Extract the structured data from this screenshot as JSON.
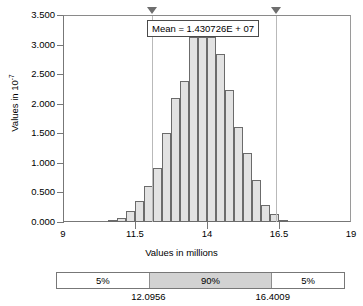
{
  "chart_data": {
    "type": "bar",
    "title": "",
    "xlabel": "Values in millions",
    "ylabel_html": "Values in 10<sup>-7</sup>",
    "ylabel": "Values in 10^-7",
    "xlim": [
      9,
      19
    ],
    "ylim": [
      0,
      3.5
    ],
    "xticks": [
      "9",
      "11.5",
      "14",
      "16.5",
      "19"
    ],
    "xtick_values": [
      9,
      11.5,
      14,
      16.5,
      19
    ],
    "yticks": [
      "0.000",
      "0.500",
      "1.000",
      "1.500",
      "2.000",
      "2.500",
      "3.000",
      "3.500"
    ],
    "ytick_values": [
      0.0,
      0.5,
      1.0,
      1.5,
      2.0,
      2.5,
      3.0,
      3.5
    ],
    "grid": false,
    "legend": "none",
    "bin_width": 0.3125,
    "bin_starts": [
      10.5625,
      10.875,
      11.1875,
      11.5,
      11.8125,
      12.125,
      12.4375,
      12.75,
      13.0625,
      13.375,
      13.6875,
      14.0,
      14.3125,
      14.625,
      14.9375,
      15.25,
      15.5625,
      15.875,
      16.1875,
      16.5,
      16.8125,
      17.125,
      17.4375
    ],
    "values": [
      0.03,
      0.07,
      0.19,
      0.35,
      0.62,
      0.91,
      1.51,
      2.11,
      2.4,
      3.14,
      3.14,
      3.14,
      2.86,
      2.25,
      1.61,
      1.17,
      0.72,
      0.29,
      0.14,
      0.03
    ],
    "annotations": [
      {
        "name": "mean-label",
        "text": "Mean = 1.430726E + 07"
      }
    ],
    "percentile_markers": [
      {
        "name": "lower-5pct-marker",
        "value": 12.0956
      },
      {
        "name": "upper-95pct-marker",
        "value": 16.4009
      }
    ]
  },
  "chart": {
    "mean_label": "Mean = 1.430726E + 07",
    "y_axis_title_prefix": "Values in 10",
    "y_axis_title_exponent": "-7",
    "x_axis_title": "Values in millions"
  },
  "certainty_band": {
    "segments": [
      {
        "name": "lower-tail",
        "label": "5%",
        "width_pct": 32.0,
        "highlight": false
      },
      {
        "name": "certainty-range",
        "label": "90%",
        "width_pct": 43.0,
        "highlight": true
      },
      {
        "name": "upper-tail",
        "label": "5%",
        "width_pct": 25.0,
        "highlight": false
      }
    ],
    "bounds": [
      {
        "name": "lower-bound-value",
        "text": "12.0956"
      },
      {
        "name": "upper-bound-value",
        "text": "16.4009"
      }
    ]
  },
  "colors": {
    "bar_fill": "#e2e2e2",
    "bar_stroke": "#6b6b6b",
    "axis": "#777777",
    "highlight_fill": "#d2d2d2",
    "grabline": "#b9b9b9",
    "background": "#ffffff"
  }
}
